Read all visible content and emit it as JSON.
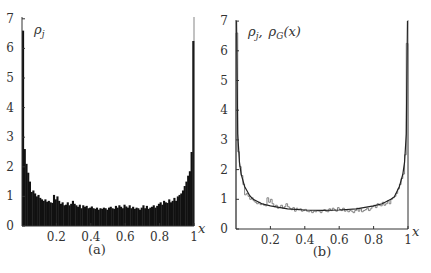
{
  "chart_data": [
    {
      "panel": "(a)",
      "type": "bar",
      "title": "",
      "legend_label": "ρ_j",
      "xlabel": "x",
      "ylabel": "",
      "xlim": [
        0,
        1
      ],
      "ylim": [
        0,
        7
      ],
      "xticks": [
        "0.2",
        "0.4",
        "0.6",
        "0.8",
        "1"
      ],
      "yticks": [
        "0",
        "1",
        "2",
        "3",
        "4",
        "5",
        "6",
        "7"
      ],
      "grid": false,
      "caption": "(a)",
      "bins": 100,
      "values": [
        6.6,
        2.6,
        2.1,
        1.8,
        1.5,
        1.15,
        1.2,
        1.1,
        1.0,
        1.05,
        0.95,
        0.9,
        0.85,
        0.9,
        0.82,
        0.85,
        0.8,
        0.78,
        1.05,
        0.9,
        1.0,
        0.85,
        0.75,
        0.8,
        0.7,
        0.72,
        0.8,
        0.7,
        0.75,
        0.85,
        0.75,
        0.7,
        0.65,
        0.72,
        0.6,
        0.7,
        0.65,
        0.68,
        0.6,
        0.62,
        0.66,
        0.6,
        0.58,
        0.62,
        0.55,
        0.6,
        0.58,
        0.62,
        0.6,
        0.55,
        0.62,
        0.65,
        0.6,
        0.58,
        0.68,
        0.62,
        0.7,
        0.65,
        0.6,
        0.72,
        0.66,
        0.62,
        0.7,
        0.6,
        0.65,
        0.58,
        0.62,
        0.6,
        0.55,
        0.62,
        0.7,
        0.6,
        0.68,
        0.58,
        0.62,
        0.65,
        0.7,
        0.62,
        0.68,
        0.75,
        0.8,
        0.72,
        0.85,
        0.8,
        0.78,
        0.9,
        0.8,
        0.85,
        0.95,
        0.85,
        1.0,
        1.05,
        1.1,
        1.2,
        1.35,
        1.5,
        1.7,
        1.85,
        2.5,
        6.25
      ]
    },
    {
      "panel": "(b)",
      "type": "line",
      "title": "",
      "legend_label": "ρ_j,  ρ_G(x)",
      "xlabel": "x",
      "ylabel": "",
      "xlim": [
        0,
        1
      ],
      "ylim": [
        0,
        7
      ],
      "xticks": [
        "0.2",
        "0.4",
        "0.6",
        "0.8",
        "1"
      ],
      "yticks": [
        "0",
        "1",
        "2",
        "3",
        "4",
        "5",
        "6",
        "7"
      ],
      "grid": false,
      "caption": "(b)",
      "series": [
        {
          "name": "ρ_j (histogram, step outline)",
          "style": "step"
        },
        {
          "name": "ρ_G(x) (smooth curve)",
          "style": "line",
          "x": [
            0.003,
            0.01,
            0.02,
            0.03,
            0.05,
            0.08,
            0.1,
            0.15,
            0.2,
            0.3,
            0.4,
            0.5,
            0.6,
            0.7,
            0.8,
            0.85,
            0.9,
            0.92,
            0.95,
            0.97,
            0.98,
            0.99,
            0.997
          ],
          "y": [
            7.0,
            3.2,
            2.25,
            1.85,
            1.43,
            1.12,
            1.0,
            0.85,
            0.78,
            0.68,
            0.64,
            0.63,
            0.64,
            0.68,
            0.78,
            0.85,
            1.0,
            1.08,
            1.43,
            1.85,
            2.25,
            3.2,
            7.0
          ]
        }
      ]
    }
  ],
  "labels": {
    "panel_a": {
      "legend": "ρ",
      "legend_sub": "j",
      "x_axis": "x",
      "caption": "(a)"
    },
    "panel_b": {
      "legend1": "ρ",
      "legend1_sub": "j",
      "sep": ",",
      "legend2": "ρ",
      "legend2_sub": "G",
      "legend2_arg": "(x)",
      "x_axis": "x",
      "caption": "(b)"
    }
  }
}
